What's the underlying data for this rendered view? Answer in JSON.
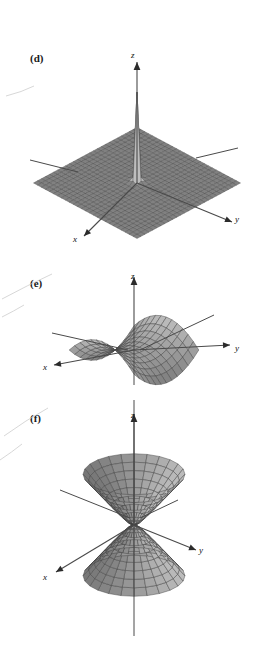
{
  "figure": {
    "background_color": "#ffffff",
    "ink_color": "#3d3d3d",
    "surface_fill": "#9a9a9a",
    "panels": [
      {
        "id": "d",
        "label": "(d)",
        "surface_type": "spike-singularity",
        "description": "Surface with a tall central spike rising from a flat grid plane, viewed in 3D perspective",
        "axes": {
          "x": "x",
          "y": "y",
          "z": "z"
        },
        "label_pos": {
          "x": 30,
          "y": 61
        },
        "axis_label_pos": {
          "z": {
            "x": 131,
            "y": 56
          },
          "y": {
            "x": 235,
            "y": 219
          },
          "x": {
            "x": 74,
            "y": 239
          }
        }
      },
      {
        "id": "e",
        "label": "(e)",
        "surface_type": "hyperbolic-paraboloid",
        "description": "Saddle surface (hyperbolic paraboloid) centered at the origin",
        "axes": {
          "x": "x",
          "y": "y",
          "z": "z"
        },
        "label_pos": {
          "x": 30,
          "y": 284
        },
        "axis_label_pos": {
          "z": {
            "x": 131,
            "y": 277
          },
          "y": {
            "x": 235,
            "y": 348
          },
          "x": {
            "x": 44,
            "y": 367
          }
        }
      },
      {
        "id": "f",
        "label": "(f)",
        "surface_type": "hyperboloid-two-sheets",
        "description": "Hyperboloid of two sheets: an upward-opening bowl above the origin and a downward-opening bowl below",
        "axes": {
          "x": "x",
          "y": "y",
          "z": "z"
        },
        "label_pos": {
          "x": 30,
          "y": 421
        },
        "axis_label_pos": {
          "z": {
            "x": 131,
            "y": 415
          },
          "y": {
            "x": 199,
            "y": 550
          },
          "x": {
            "x": 44,
            "y": 577
          }
        }
      }
    ]
  },
  "chart_data": [
    {
      "type": "surface",
      "panel": "d",
      "title": "(d)",
      "equation": "z = 1/(x^2 + y^2)",
      "xlabel": "x",
      "ylabel": "y",
      "zlabel": "z",
      "grid": true,
      "legend": "none",
      "description": "Rectangular mesh surface that is nearly flat over most of the domain and blows up to a narrow vertical spike at the origin"
    },
    {
      "type": "surface",
      "panel": "e",
      "title": "(e)",
      "equation": "z = x^2 - y^2",
      "xlabel": "x",
      "ylabel": "y",
      "zlabel": "z",
      "grid": true,
      "legend": "none",
      "description": "Saddle-shaped mesh surface rising along one axis and falling along the perpendicular axis"
    },
    {
      "type": "surface",
      "panel": "f",
      "title": "(f)",
      "equation": "z^2 - x^2 - y^2 = 1",
      "xlabel": "x",
      "ylabel": "y",
      "zlabel": "z",
      "grid": true,
      "legend": "none",
      "description": "Two separate bowl-shaped mesh sheets, one opening upward above the origin and one opening downward below"
    }
  ]
}
